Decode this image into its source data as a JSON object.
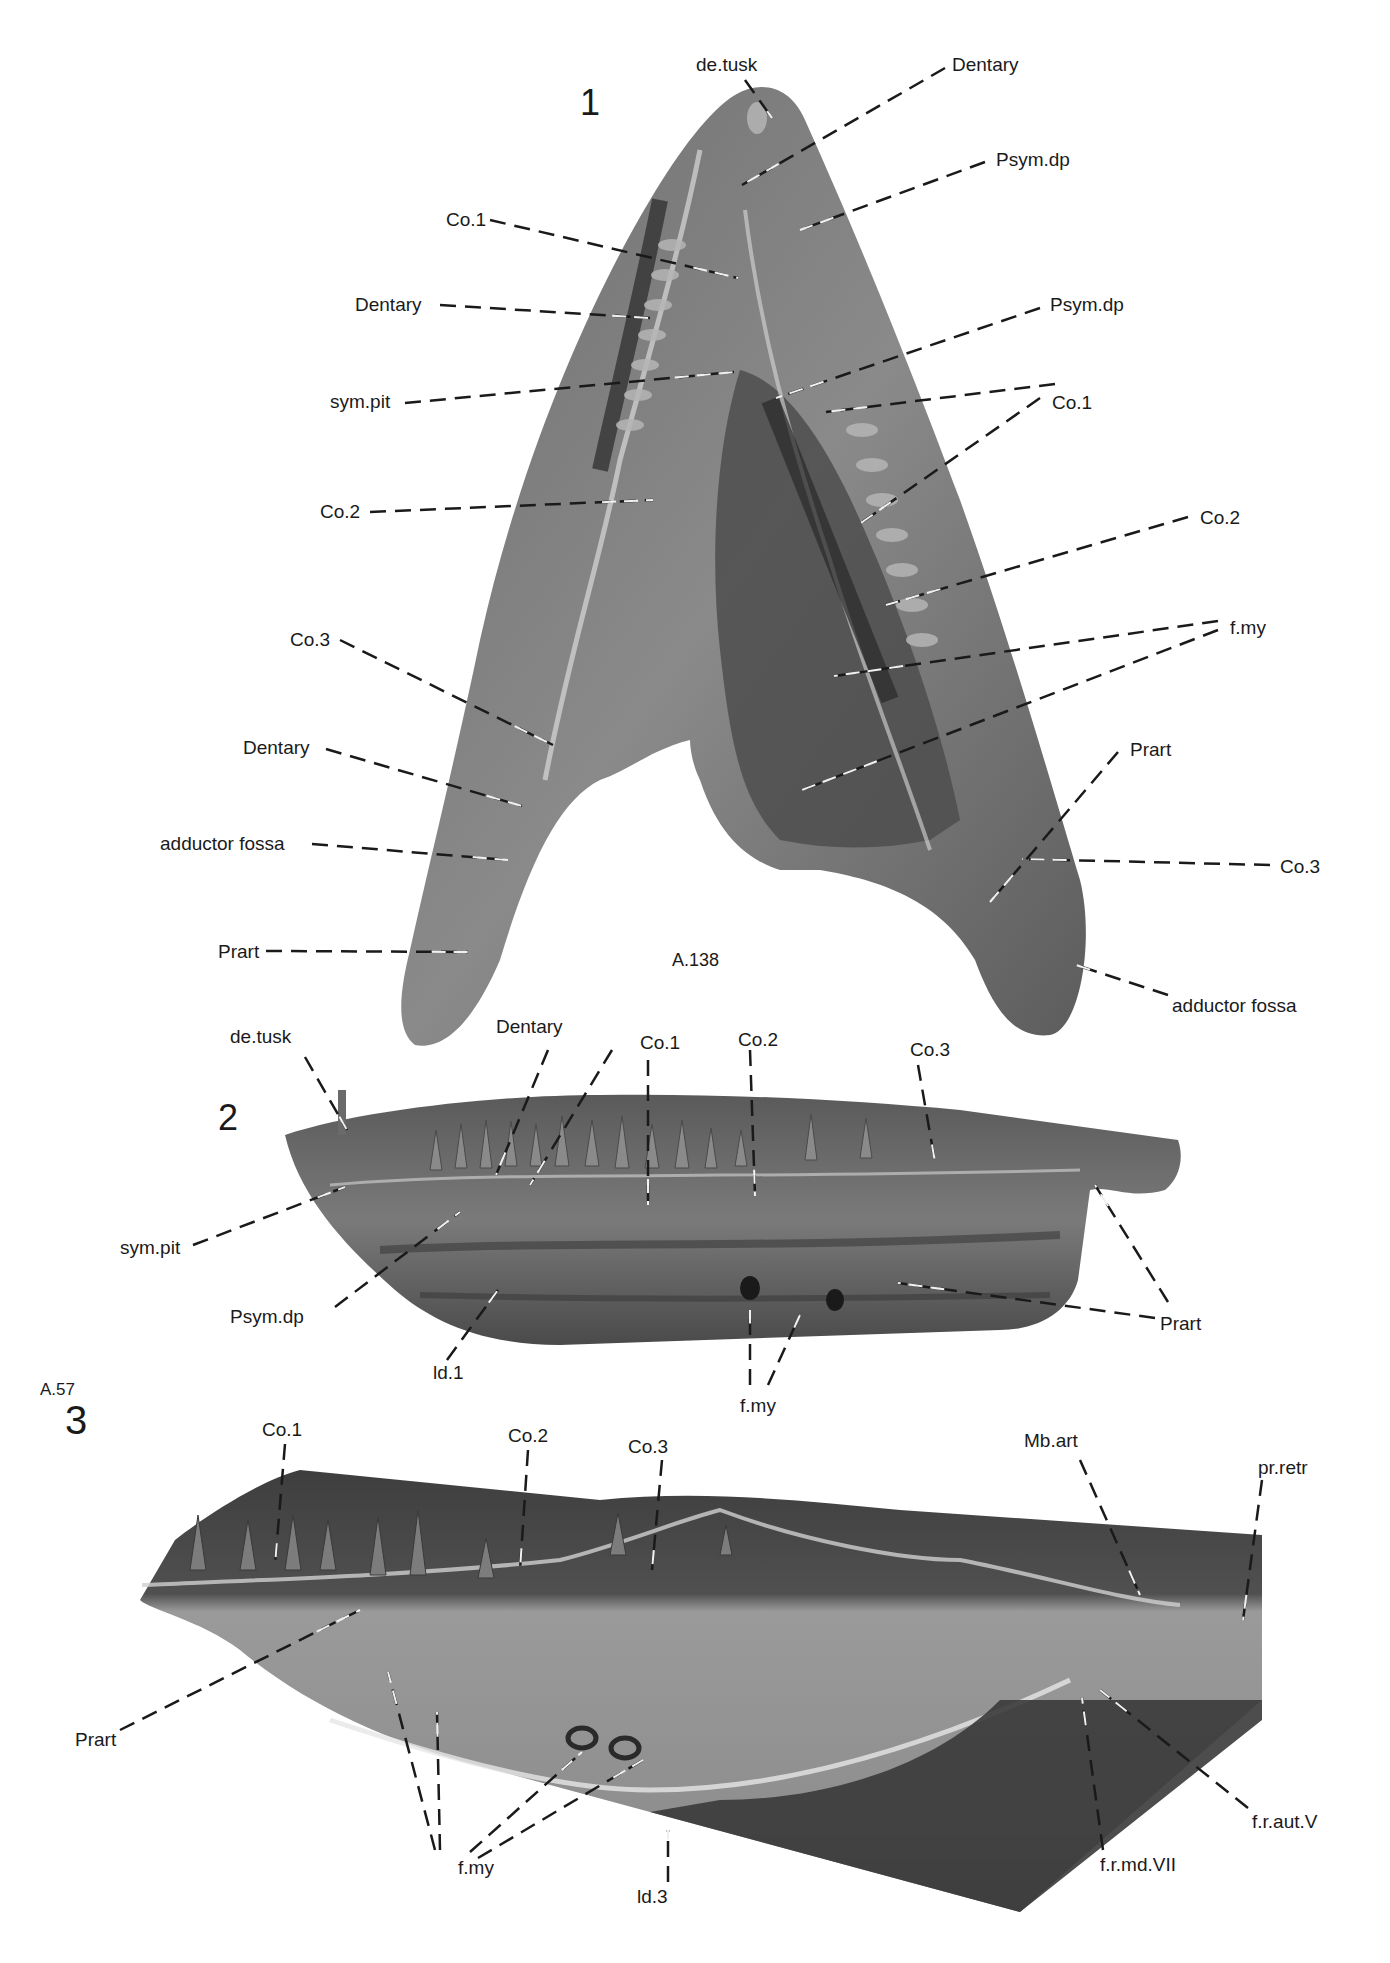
{
  "figure": {
    "panels": [
      {
        "number": "1",
        "specimen": "A.138",
        "view": "ventral/dorsal view of paired lower jaws",
        "labels": [
          {
            "text": "de.tusk",
            "x": 696,
            "y": 55,
            "lines": [
              [
                745,
                80,
                772,
                118
              ]
            ]
          },
          {
            "text": "Dentary",
            "x": 952,
            "y": 55,
            "lines": [
              [
                945,
                68,
                742,
                185
              ]
            ]
          },
          {
            "text": "Co.1",
            "x": 446,
            "y": 210,
            "lines": [
              [
                490,
                220,
                738,
                278
              ]
            ]
          },
          {
            "text": "Psym.dp",
            "x": 996,
            "y": 150,
            "lines": [
              [
                985,
                162,
                800,
                230
              ]
            ]
          },
          {
            "text": "Dentary",
            "x": 355,
            "y": 295,
            "lines": [
              [
                440,
                305,
                650,
                318
              ]
            ]
          },
          {
            "text": "Psym.dp",
            "x": 1050,
            "y": 295,
            "lines": [
              [
                1040,
                308,
                776,
                398
              ]
            ]
          },
          {
            "text": "sym.pit",
            "x": 330,
            "y": 392,
            "lines": [
              [
                405,
                403,
                734,
                372
              ]
            ]
          },
          {
            "text": "Co.1",
            "x": 1052,
            "y": 393,
            "lines": [
              [
                1055,
                384,
                826,
                412
              ],
              [
                1040,
                398,
                858,
                525
              ]
            ]
          },
          {
            "text": "Co.2",
            "x": 320,
            "y": 502,
            "lines": [
              [
                370,
                512,
                653,
                500
              ]
            ]
          },
          {
            "text": "Co.2",
            "x": 1200,
            "y": 508,
            "lines": [
              [
                1188,
                517,
                886,
                605
              ]
            ]
          },
          {
            "text": "Co.3",
            "x": 290,
            "y": 630,
            "lines": [
              [
                340,
                640,
                553,
                745
              ]
            ]
          },
          {
            "text": "f.my",
            "x": 1230,
            "y": 618,
            "lines": [
              [
                1218,
                621,
                834,
                676
              ],
              [
                1218,
                630,
                802,
                790
              ]
            ]
          },
          {
            "text": "Dentary",
            "x": 243,
            "y": 738,
            "lines": [
              [
                326,
                749,
                522,
                806
              ]
            ]
          },
          {
            "text": "Prart",
            "x": 1130,
            "y": 740,
            "lines": [
              [
                1118,
                752,
                990,
                902
              ]
            ]
          },
          {
            "text": "adductor fossa",
            "x": 160,
            "y": 834,
            "lines": [
              [
                312,
                844,
                508,
                860
              ]
            ]
          },
          {
            "text": "Co.3",
            "x": 1280,
            "y": 857,
            "lines": [
              [
                1270,
                865,
                1022,
                859
              ]
            ]
          },
          {
            "text": "Prart",
            "x": 218,
            "y": 942,
            "lines": [
              [
                266,
                951,
                468,
                952
              ]
            ]
          },
          {
            "text": "adductor fossa",
            "x": 1172,
            "y": 996,
            "lines": [
              [
                1168,
                995,
                1073,
                964
              ]
            ]
          }
        ]
      },
      {
        "number": "2",
        "specimen": "",
        "view": "lateral view of lower jaw",
        "labels": [
          {
            "text": "de.tusk",
            "x": 230,
            "y": 1027,
            "lines": [
              [
                305,
                1057,
                347,
                1130
              ]
            ]
          },
          {
            "text": "Dentary",
            "x": 496,
            "y": 1017,
            "lines": [
              [
                548,
                1050,
                496,
                1175
              ]
            ]
          },
          {
            "text": "Co.1",
            "x": 640,
            "y": 1033,
            "lines": [
              [
                612,
                1050,
                530,
                1185
              ],
              [
                648,
                1060,
                648,
                1205
              ]
            ]
          },
          {
            "text": "Co.2",
            "x": 738,
            "y": 1030,
            "lines": [
              [
                750,
                1050,
                755,
                1196
              ]
            ]
          },
          {
            "text": "Co.3",
            "x": 910,
            "y": 1040,
            "lines": [
              [
                918,
                1065,
                935,
                1162
              ]
            ]
          },
          {
            "text": "sym.pit",
            "x": 120,
            "y": 1238,
            "lines": [
              [
                193,
                1245,
                345,
                1187
              ]
            ]
          },
          {
            "text": "Psym.dp",
            "x": 230,
            "y": 1307,
            "lines": [
              [
                335,
                1307,
                460,
                1212
              ]
            ]
          },
          {
            "text": "ld.1",
            "x": 433,
            "y": 1363,
            "lines": [
              [
                447,
                1360,
                498,
                1290
              ]
            ]
          },
          {
            "text": "f.my",
            "x": 740,
            "y": 1396,
            "lines": [
              [
                750,
                1385,
                750,
                1310
              ],
              [
                768,
                1385,
                800,
                1315
              ]
            ]
          },
          {
            "text": "Prart",
            "x": 1160,
            "y": 1314,
            "lines": [
              [
                1155,
                1318,
                898,
                1283
              ],
              [
                1168,
                1302,
                1095,
                1185
              ]
            ]
          }
        ]
      },
      {
        "number": "3",
        "specimen": "A.57",
        "view": "lateral view of lower jaw",
        "labels": [
          {
            "text": "Co.1",
            "x": 262,
            "y": 1420,
            "lines": [
              [
                285,
                1444,
                275,
                1565
              ]
            ]
          },
          {
            "text": "Co.2",
            "x": 508,
            "y": 1426,
            "lines": [
              [
                528,
                1450,
                520,
                1570
              ]
            ]
          },
          {
            "text": "Co.3",
            "x": 628,
            "y": 1437,
            "lines": [
              [
                662,
                1460,
                652,
                1570
              ]
            ]
          },
          {
            "text": "Mb.art",
            "x": 1024,
            "y": 1431,
            "lines": [
              [
                1080,
                1460,
                1140,
                1595
              ]
            ]
          },
          {
            "text": "pr.retr",
            "x": 1258,
            "y": 1458,
            "lines": [
              [
                1262,
                1480,
                1243,
                1620
              ]
            ]
          },
          {
            "text": "Prart",
            "x": 75,
            "y": 1730,
            "lines": [
              [
                120,
                1730,
                360,
                1610
              ]
            ]
          },
          {
            "text": "f.my",
            "x": 458,
            "y": 1858,
            "lines": [
              [
                435,
                1850,
                388,
                1672
              ],
              [
                440,
                1850,
                437,
                1712
              ],
              [
                470,
                1852,
                582,
                1752
              ],
              [
                478,
                1858,
                643,
                1760
              ]
            ]
          },
          {
            "text": "ld.3",
            "x": 637,
            "y": 1887,
            "lines": [
              [
                668,
                1882,
                668,
                1830
              ]
            ]
          },
          {
            "text": "f.r.md.VII",
            "x": 1100,
            "y": 1855,
            "lines": [
              [
                1103,
                1850,
                1082,
                1698
              ]
            ]
          },
          {
            "text": "f.r.aut.V",
            "x": 1252,
            "y": 1812,
            "lines": [
              [
                1248,
                1808,
                1100,
                1690
              ]
            ]
          }
        ]
      }
    ]
  }
}
